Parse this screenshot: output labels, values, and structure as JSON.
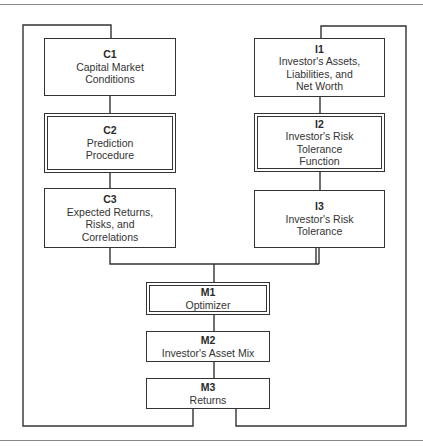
{
  "diagram": {
    "type": "flowchart",
    "left_column": [
      {
        "id": "C1",
        "label": "Capital Market\nConditions",
        "style": "single"
      },
      {
        "id": "C2",
        "label": "Prediction\nProcedure",
        "style": "double"
      },
      {
        "id": "C3",
        "label": "Expected Returns,\nRisks, and\nCorrelations",
        "style": "single"
      }
    ],
    "right_column": [
      {
        "id": "I1",
        "label": "Investor's Assets,\nLiabilities, and\nNet Worth",
        "style": "single"
      },
      {
        "id": "I2",
        "label": "Investor's Risk\nTolerance\nFunction",
        "style": "double"
      },
      {
        "id": "I3",
        "label": "Investor's Risk\nTolerance",
        "style": "single"
      }
    ],
    "center_column": [
      {
        "id": "M1",
        "label": "Optimizer",
        "style": "double"
      },
      {
        "id": "M2",
        "label": "Investor's Asset Mix",
        "style": "single"
      },
      {
        "id": "M3",
        "label": "Returns",
        "style": "single"
      }
    ],
    "edges": [
      [
        "C1",
        "C2"
      ],
      [
        "C2",
        "C3"
      ],
      [
        "I1",
        "I2"
      ],
      [
        "I2",
        "I3"
      ],
      [
        "C3",
        "M1"
      ],
      [
        "I3",
        "M1"
      ],
      [
        "M1",
        "M2"
      ],
      [
        "M2",
        "M3"
      ],
      [
        "M3",
        "C1"
      ],
      [
        "M3",
        "I1"
      ]
    ],
    "colors": {
      "line": "#333333",
      "rule": "#8a8a8a",
      "background": "#ffffff"
    }
  }
}
